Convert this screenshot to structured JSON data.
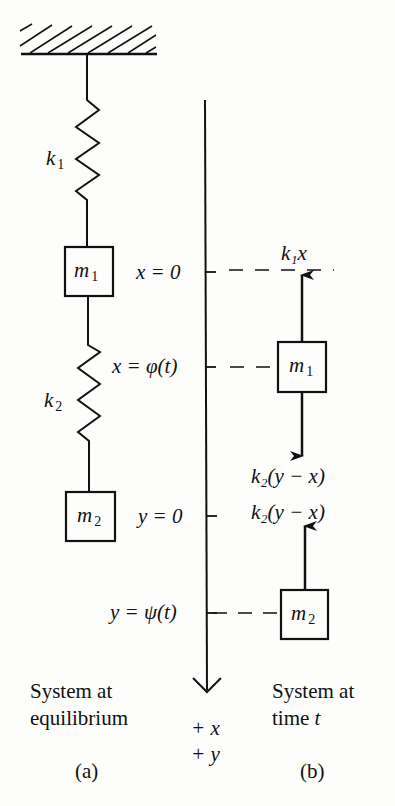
{
  "diagram": {
    "type": "two-mass spring system",
    "panel_a": {
      "caption_line1": "System at",
      "caption_line2": "equilibrium",
      "label": "(a)",
      "spring1": {
        "label_main": "k",
        "label_sub": "1"
      },
      "spring2": {
        "label_main": "k",
        "label_sub": "2"
      },
      "mass1": {
        "label_main": "m",
        "label_sub": "1"
      },
      "mass2": {
        "label_main": "m",
        "label_sub": "2"
      }
    },
    "axis": {
      "tick_x0": "x = 0",
      "tick_xphi": "x = φ(t)",
      "tick_y0": "y = 0",
      "tick_ypsi": "y = ψ(t)",
      "direction_x": "+ x",
      "direction_y": "+ y"
    },
    "panel_b": {
      "caption_line1": "System at",
      "caption_line2_text": "time ",
      "caption_line2_var": "t",
      "label": "(b)",
      "force_up_m1": "k₁x",
      "force_down_m1": "k₂(y − x)",
      "force_up_m2": "k₂(y − x)",
      "mass1": {
        "label_main": "m",
        "label_sub": "1"
      },
      "mass2": {
        "label_main": "m",
        "label_sub": "2"
      }
    }
  }
}
